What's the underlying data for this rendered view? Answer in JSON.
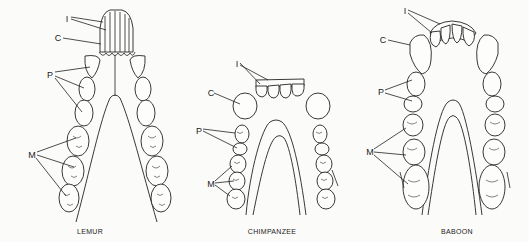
{
  "figure": {
    "panels": [
      {
        "id": "lemur",
        "caption": "LEMUR",
        "caption_pos": [
          90,
          232
        ],
        "labels": [
          {
            "text": "I",
            "pos": [
              67,
              19
            ]
          },
          {
            "text": "C",
            "pos": [
              58,
              38
            ]
          },
          {
            "text": "P",
            "pos": [
              50,
              75
            ]
          },
          {
            "text": "M",
            "pos": [
              32,
              155
            ]
          }
        ]
      },
      {
        "id": "chimpanzee",
        "caption": "CHIMPANZEE",
        "caption_pos": [
          272,
          232
        ],
        "labels": [
          {
            "text": "I",
            "pos": [
              237,
              64
            ]
          },
          {
            "text": "C",
            "pos": [
              211,
              93
            ]
          },
          {
            "text": "P",
            "pos": [
              199,
              131
            ]
          },
          {
            "text": "M",
            "pos": [
              211,
              184
            ]
          }
        ]
      },
      {
        "id": "baboon",
        "caption": "BABOON",
        "caption_pos": [
          457,
          232
        ],
        "labels": [
          {
            "text": "I",
            "pos": [
              405,
              11
            ]
          },
          {
            "text": "C",
            "pos": [
              383,
              40
            ]
          },
          {
            "text": "P",
            "pos": [
              381,
              92
            ]
          },
          {
            "text": "M",
            "pos": [
              370,
              152
            ]
          }
        ]
      }
    ],
    "legend_meaning": {
      "I": "Incisors",
      "C": "Canine",
      "P": "Premolars",
      "M": "Molars"
    },
    "colors": {
      "ink": "#222222",
      "paper": "#fbfbf9"
    }
  }
}
